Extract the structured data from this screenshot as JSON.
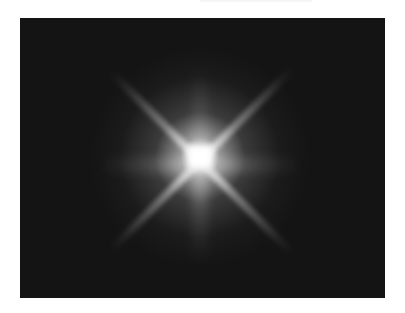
{
  "image": {
    "subject": "bright star with diffraction spikes",
    "background_color": "#141414",
    "page_background": "#ffffff",
    "star": {
      "center": [
        200,
        157
      ],
      "core_color": "#ffffff",
      "diagonal_rays": 4,
      "axis_rays": 4
    }
  }
}
